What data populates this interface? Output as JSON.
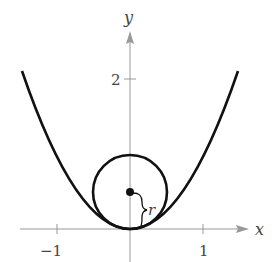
{
  "diagram": {
    "axes": {
      "x_label": "x",
      "y_label": "y",
      "x_ticks": [
        {
          "value": -1,
          "label": "−1"
        },
        {
          "value": 1,
          "label": "1"
        }
      ],
      "y_ticks": [
        {
          "value": 2,
          "label": "2"
        }
      ],
      "color": "#999999"
    },
    "curve": {
      "equation": "y = x^2",
      "x_range": [
        -1.46,
        1.46
      ],
      "color": "#111111"
    },
    "circle": {
      "center": [
        0,
        0.5
      ],
      "radius": 0.5,
      "radius_label": "r",
      "color": "#111111"
    }
  }
}
